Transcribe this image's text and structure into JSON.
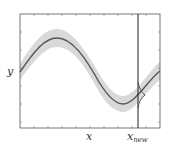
{
  "diagram": {
    "type": "gaussian-process-regression",
    "y_label": "y",
    "x_label": "x",
    "x_new_label": "x",
    "x_new_subscript": "new",
    "colors": {
      "mean_line": "#555555",
      "band": "#d9d9d9",
      "frame": "#444444",
      "x_new_line": "#222222"
    }
  }
}
